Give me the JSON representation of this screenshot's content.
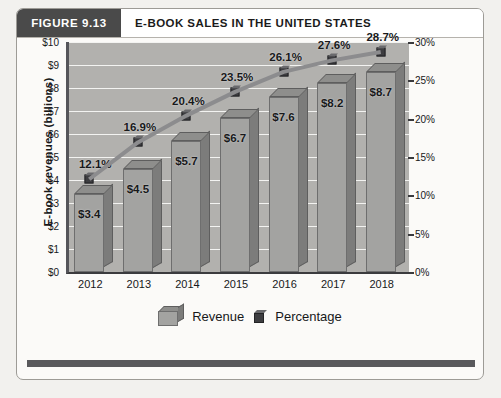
{
  "header": {
    "figure_tag": "FIGURE 9.13",
    "title": "E-BOOK SALES IN THE UNITED STATES"
  },
  "legend": {
    "revenue_label": "Revenue",
    "percentage_label": "Percentage"
  },
  "colors": {
    "header_tag_bg": "#4a4a4a",
    "plot_bg": "#b2b1ae",
    "bar_front": "#a3a3a1",
    "bar_side": "#7c7c7b",
    "bar_top": "#8e8e8c",
    "line": "#8c8c8e",
    "marker": "#3d3d40",
    "gridline": "#f3f3f1",
    "page_bg": "#f2f1ee",
    "panel_bg": "#fbfaf8",
    "footer_rule": "#59595c"
  },
  "chart_data": {
    "type": "bar",
    "title": "E-BOOK SALES IN THE UNITED STATES",
    "xlabel": "",
    "ylabel": "E-book revenues  (billions)",
    "y2label": "",
    "categories": [
      "2012",
      "2013",
      "2014",
      "2015",
      "2016",
      "2017",
      "2018"
    ],
    "ylim": [
      0,
      10
    ],
    "y2lim": [
      0,
      30
    ],
    "yticks": [
      "$0",
      "$1",
      "$2",
      "$3",
      "$4",
      "$5",
      "$6",
      "$7",
      "$8",
      "$9",
      "$10"
    ],
    "ytick_values": [
      0,
      1,
      2,
      3,
      4,
      5,
      6,
      7,
      8,
      9,
      10
    ],
    "y2ticks": [
      "0%",
      "5%",
      "10%",
      "15%",
      "20%",
      "25%",
      "30%"
    ],
    "y2tick_values": [
      0,
      5,
      10,
      15,
      20,
      25,
      30
    ],
    "grid": true,
    "legend_position": "bottom",
    "series": [
      {
        "name": "Revenue",
        "type": "bar",
        "axis": "left",
        "values": [
          3.4,
          4.5,
          5.7,
          6.7,
          7.6,
          8.2,
          8.7
        ],
        "labels": [
          "$3.4",
          "$4.5",
          "$5.7",
          "$6.7",
          "$7.6",
          "$8.2",
          "$8.7"
        ]
      },
      {
        "name": "Percentage",
        "type": "line",
        "axis": "right",
        "values": [
          12.1,
          16.9,
          20.4,
          23.5,
          26.1,
          27.6,
          28.7
        ],
        "labels": [
          "12.1%",
          "16.9%",
          "20.4%",
          "23.5%",
          "26.1%",
          "27.6%",
          "28.7%"
        ]
      }
    ]
  }
}
